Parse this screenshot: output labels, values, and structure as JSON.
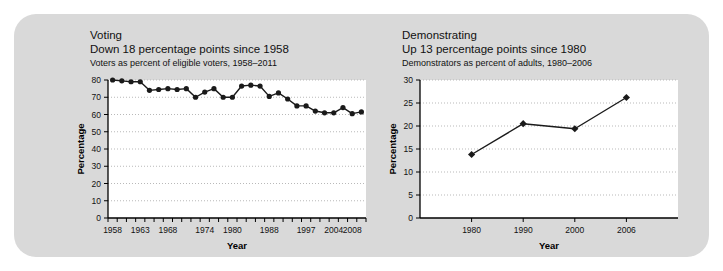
{
  "panel": {
    "background_color": "#d9d9d9",
    "page_background": "#ffffff"
  },
  "chart_data": [
    {
      "id": "voting",
      "type": "line",
      "title": "Voting",
      "subtitle": "Down 18 percentage points since 1958",
      "caption": "Voters as percent of eligible voters, 1958–2011",
      "xlabel": "Year",
      "ylabel": "Percentage",
      "ylim": [
        0,
        80
      ],
      "ytick_values": [
        0,
        10,
        20,
        30,
        40,
        50,
        60,
        70,
        80
      ],
      "ytick_labels": [
        "0",
        "10",
        "20",
        "30",
        "40",
        "50",
        "60",
        "70",
        "80"
      ],
      "xtick_labels": [
        "1958",
        "1963",
        "1968",
        "1974",
        "1980",
        "1988",
        "1997",
        "2004",
        "2008"
      ],
      "xtick_label_indices": [
        0,
        3,
        6,
        10,
        13,
        17,
        21,
        24,
        26
      ],
      "n_ticks": 28,
      "grid": true,
      "legend": "none",
      "marker": "circle",
      "line_color": "#1a1a1a",
      "marker_color": "#1a1a1a",
      "x": [
        1958,
        1960,
        1962,
        1963,
        1964,
        1966,
        1968,
        1970,
        1972,
        1974,
        1976,
        1978,
        1980,
        1982,
        1984,
        1986,
        1988,
        1990,
        1992,
        1994,
        1997,
        1998,
        2000,
        2002,
        2004,
        2006,
        2008,
        2011
      ],
      "values": [
        80,
        79.5,
        79,
        79,
        74,
        74.5,
        75,
        74.5,
        75,
        70,
        73,
        75,
        70,
        70,
        76.5,
        77,
        76.5,
        70.5,
        72.5,
        69,
        65,
        65,
        62,
        61,
        61,
        64,
        60.5,
        61.5
      ]
    },
    {
      "id": "demonstrating",
      "type": "line",
      "title": "Demonstrating",
      "subtitle": "Up 13 percentage points since 1980",
      "caption": "Demonstrators as percent of adults, 1980–2006",
      "xlabel": "Year",
      "ylabel": "Percentage",
      "ylim": [
        0,
        30
      ],
      "ytick_values": [
        0,
        5,
        10,
        15,
        20,
        25,
        30
      ],
      "ytick_labels": [
        "0",
        "5",
        "10",
        "15",
        "20",
        "25",
        "30"
      ],
      "xtick_labels": [
        "1980",
        "1990",
        "2000",
        "2006"
      ],
      "grid": true,
      "legend": "none",
      "marker": "diamond",
      "line_color": "#1a1a1a",
      "marker_color": "#1a1a1a",
      "x": [
        1980,
        1990,
        2000,
        2006
      ],
      "values": [
        13.8,
        20.5,
        19.4,
        26.2
      ]
    }
  ]
}
